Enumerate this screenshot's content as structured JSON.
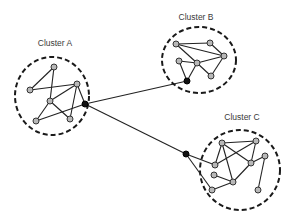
{
  "diagram": {
    "type": "network-clusters",
    "clusters": [
      {
        "id": "A",
        "label": "Cluster A",
        "label_pos": [
          55,
          46
        ],
        "boundary": {
          "cx": 52,
          "cy": 96,
          "rx": 37,
          "ry": 39
        },
        "nodes": [
          [
            54,
            67
          ],
          [
            30,
            90
          ],
          [
            77,
            84
          ],
          [
            50,
            101
          ],
          [
            36,
            121
          ],
          [
            70,
            119
          ]
        ],
        "hub": [
          85,
          104
        ],
        "edges": [
          [
            0,
            1
          ],
          [
            0,
            3
          ],
          [
            1,
            2
          ],
          [
            2,
            3
          ],
          [
            2,
            5
          ],
          [
            2,
            "hub"
          ],
          [
            3,
            4
          ],
          [
            3,
            5
          ],
          [
            4,
            "hub"
          ]
        ]
      },
      {
        "id": "B",
        "label": "Cluster B",
        "label_pos": [
          196,
          20
        ],
        "boundary": {
          "cx": 199,
          "cy": 60,
          "rx": 37,
          "ry": 33
        },
        "nodes": [
          [
            176,
            44
          ],
          [
            210,
            43
          ],
          [
            224,
            56
          ],
          [
            179,
            61
          ],
          [
            197,
            63
          ],
          [
            211,
            76
          ]
        ],
        "hub": [
          187,
          81
        ],
        "edges": [
          [
            0,
            1
          ],
          [
            0,
            2
          ],
          [
            0,
            4
          ],
          [
            1,
            2
          ],
          [
            2,
            4
          ],
          [
            2,
            5
          ],
          [
            3,
            4
          ],
          [
            3,
            "hub"
          ],
          [
            4,
            "hub"
          ],
          [
            4,
            5
          ]
        ]
      },
      {
        "id": "C",
        "label": "Cluster C",
        "label_pos": [
          242,
          120
        ],
        "boundary": {
          "cx": 240,
          "cy": 170,
          "rx": 40,
          "ry": 40
        },
        "nodes": [
          [
            222,
            143
          ],
          [
            256,
            141
          ],
          [
            215,
            165
          ],
          [
            251,
            163
          ],
          [
            265,
            156
          ],
          [
            214,
            175
          ],
          [
            233,
            182
          ],
          [
            212,
            190
          ],
          [
            258,
            190
          ]
        ],
        "hub": [
          186,
          154
        ],
        "edges": [
          [
            0,
            1
          ],
          [
            0,
            2
          ],
          [
            0,
            3
          ],
          [
            0,
            6
          ],
          [
            1,
            2
          ],
          [
            1,
            3
          ],
          [
            3,
            4
          ],
          [
            3,
            6
          ],
          [
            4,
            8
          ],
          [
            5,
            6
          ],
          [
            6,
            7
          ],
          [
            "hub",
            2
          ],
          [
            "hub",
            7
          ]
        ]
      }
    ],
    "bridges": [
      [
        "A",
        "B"
      ],
      [
        "A",
        "C"
      ]
    ]
  }
}
